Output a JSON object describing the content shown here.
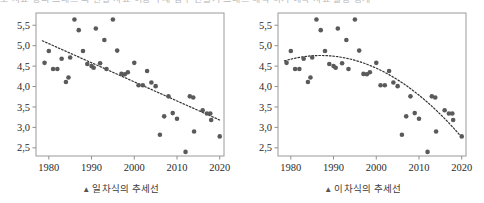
{
  "top_cut_text": "도 자료 정리 그래프 의 관찰 자료 이용 추세 함수 만들기 그래프 해석 하기 예측 자료 활용 통계",
  "charts": [
    {
      "id": "linear",
      "caption": "일차식의 추세선",
      "caption_marker": "▲"
    },
    {
      "id": "quadratic",
      "caption": "이차식의 추세선",
      "caption_marker": "▲"
    }
  ],
  "chart_data": [
    {
      "type": "scatter",
      "title": "일차식의 추세선",
      "xlabel": "",
      "ylabel": "",
      "xlim": [
        1977,
        2021
      ],
      "ylim": [
        2.3,
        5.8
      ],
      "xticks": [
        1980,
        1990,
        2000,
        2010,
        2020
      ],
      "xticklabels": [
        "1980",
        "1990",
        "2000",
        "2010",
        "2020"
      ],
      "yticks": [
        2.5,
        3.0,
        3.5,
        4.0,
        4.5,
        5.0,
        5.5
      ],
      "yticklabels": [
        "2,5",
        "3,0",
        "3,5",
        "4,0",
        "4,5",
        "5,0",
        "5,5"
      ],
      "grid": false,
      "legend": "none",
      "marker_color": "#5a5a5a",
      "trendline": {
        "kind": "linear",
        "style": "dotted",
        "color": "#333333",
        "x_start": 1978.5,
        "x_end": 2020.0,
        "y_start": 5.12,
        "y_end": 3.18
      },
      "points": [
        {
          "x": 1979,
          "y": 4.58
        },
        {
          "x": 1980,
          "y": 4.87
        },
        {
          "x": 1981,
          "y": 4.43
        },
        {
          "x": 1982,
          "y": 4.43
        },
        {
          "x": 1983,
          "y": 4.68
        },
        {
          "x": 1984,
          "y": 4.11
        },
        {
          "x": 1984.6,
          "y": 4.22
        },
        {
          "x": 1985,
          "y": 4.71
        },
        {
          "x": 1986,
          "y": 5.64
        },
        {
          "x": 1987,
          "y": 5.38
        },
        {
          "x": 1988,
          "y": 4.87
        },
        {
          "x": 1989,
          "y": 4.55
        },
        {
          "x": 1990,
          "y": 4.5
        },
        {
          "x": 1990.5,
          "y": 4.46
        },
        {
          "x": 1991,
          "y": 5.42
        },
        {
          "x": 1992,
          "y": 4.57
        },
        {
          "x": 1993,
          "y": 5.14
        },
        {
          "x": 1993.5,
          "y": 4.43
        },
        {
          "x": 1995,
          "y": 5.64
        },
        {
          "x": 1996,
          "y": 4.88
        },
        {
          "x": 1997,
          "y": 4.31
        },
        {
          "x": 1997.8,
          "y": 4.3
        },
        {
          "x": 1998.5,
          "y": 4.35
        },
        {
          "x": 2000,
          "y": 4.58
        },
        {
          "x": 2001,
          "y": 4.03
        },
        {
          "x": 2002,
          "y": 4.03
        },
        {
          "x": 2003,
          "y": 4.38
        },
        {
          "x": 2004,
          "y": 4.1
        },
        {
          "x": 2005,
          "y": 4.01
        },
        {
          "x": 2006,
          "y": 2.82
        },
        {
          "x": 2007,
          "y": 3.27
        },
        {
          "x": 2008,
          "y": 3.76
        },
        {
          "x": 2009,
          "y": 3.35
        },
        {
          "x": 2010,
          "y": 3.21
        },
        {
          "x": 2012,
          "y": 2.4
        },
        {
          "x": 2013,
          "y": 3.76
        },
        {
          "x": 2013.8,
          "y": 3.73
        },
        {
          "x": 2014,
          "y": 2.9
        },
        {
          "x": 2016,
          "y": 3.42
        },
        {
          "x": 2017,
          "y": 3.34
        },
        {
          "x": 2017.8,
          "y": 3.34
        },
        {
          "x": 2018,
          "y": 3.18
        },
        {
          "x": 2020,
          "y": 2.78
        }
      ]
    },
    {
      "type": "scatter",
      "title": "이차식의 추세선",
      "xlabel": "",
      "ylabel": "",
      "xlim": [
        1977,
        2021
      ],
      "ylim": [
        2.3,
        5.8
      ],
      "xticks": [
        1980,
        1990,
        2000,
        2010,
        2020
      ],
      "xticklabels": [
        "1980",
        "1990",
        "2000",
        "2010",
        "2020"
      ],
      "yticks": [
        2.5,
        3.0,
        3.5,
        4.0,
        4.5,
        5.0,
        5.5
      ],
      "yticklabels": [
        "2,5",
        "3,0",
        "3,5",
        "4,0",
        "4,5",
        "5,0",
        "5,5"
      ],
      "grid": false,
      "legend": "none",
      "marker_color": "#5a5a5a",
      "trendline": {
        "kind": "quadratic",
        "style": "dotted",
        "color": "#333333",
        "x_start": 1978.5,
        "x_end": 2020.0,
        "vertex_x": 1987.0,
        "vertex_y": 4.76,
        "y_start": 4.7,
        "y_end": 2.76
      },
      "points": [
        {
          "x": 1979,
          "y": 4.58
        },
        {
          "x": 1980,
          "y": 4.87
        },
        {
          "x": 1981,
          "y": 4.43
        },
        {
          "x": 1982,
          "y": 4.43
        },
        {
          "x": 1983,
          "y": 4.68
        },
        {
          "x": 1984,
          "y": 4.11
        },
        {
          "x": 1984.6,
          "y": 4.22
        },
        {
          "x": 1985,
          "y": 4.71
        },
        {
          "x": 1986,
          "y": 5.64
        },
        {
          "x": 1987,
          "y": 5.38
        },
        {
          "x": 1988,
          "y": 4.87
        },
        {
          "x": 1989,
          "y": 4.55
        },
        {
          "x": 1990,
          "y": 4.5
        },
        {
          "x": 1990.5,
          "y": 4.46
        },
        {
          "x": 1991,
          "y": 5.42
        },
        {
          "x": 1992,
          "y": 4.57
        },
        {
          "x": 1993,
          "y": 5.14
        },
        {
          "x": 1993.5,
          "y": 4.43
        },
        {
          "x": 1995,
          "y": 5.64
        },
        {
          "x": 1996,
          "y": 4.88
        },
        {
          "x": 1997,
          "y": 4.31
        },
        {
          "x": 1997.8,
          "y": 4.3
        },
        {
          "x": 1998.5,
          "y": 4.35
        },
        {
          "x": 2000,
          "y": 4.58
        },
        {
          "x": 2001,
          "y": 4.03
        },
        {
          "x": 2002,
          "y": 4.03
        },
        {
          "x": 2003,
          "y": 4.38
        },
        {
          "x": 2004,
          "y": 4.1
        },
        {
          "x": 2005,
          "y": 4.01
        },
        {
          "x": 2006,
          "y": 2.82
        },
        {
          "x": 2007,
          "y": 3.27
        },
        {
          "x": 2008,
          "y": 3.76
        },
        {
          "x": 2009,
          "y": 3.35
        },
        {
          "x": 2010,
          "y": 3.21
        },
        {
          "x": 2012,
          "y": 2.4
        },
        {
          "x": 2013,
          "y": 3.76
        },
        {
          "x": 2013.8,
          "y": 3.73
        },
        {
          "x": 2014,
          "y": 2.9
        },
        {
          "x": 2016,
          "y": 3.42
        },
        {
          "x": 2017,
          "y": 3.34
        },
        {
          "x": 2017.8,
          "y": 3.34
        },
        {
          "x": 2018,
          "y": 3.18
        },
        {
          "x": 2020,
          "y": 2.78
        }
      ]
    }
  ]
}
